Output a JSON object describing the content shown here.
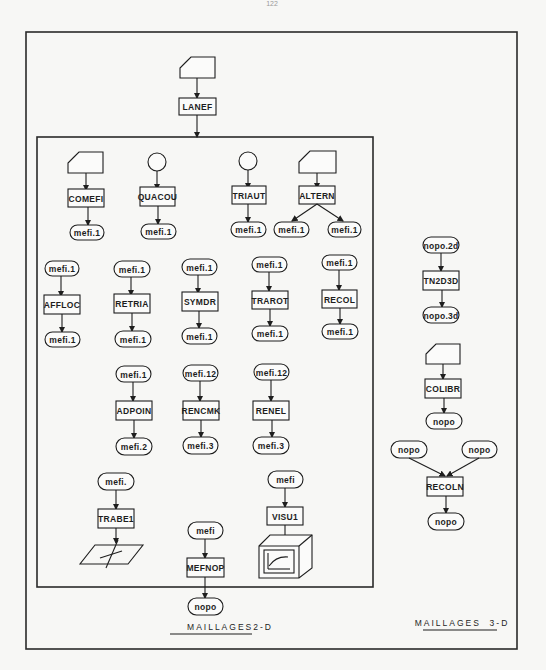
{
  "page": {
    "number": "122"
  },
  "colors": {
    "ink": "#1e1e1e",
    "paper": "#f7f7f5"
  },
  "top": {
    "input": {
      "kind": "card"
    },
    "process": "LANEF"
  },
  "sections": {
    "two_d": {
      "caption": "MAILLAGES2-D",
      "row1": [
        {
          "input": "card",
          "process": "COMEFI",
          "outputs": [
            "mefi.1"
          ]
        },
        {
          "input": "circle",
          "process": "QUACOU",
          "outputs": [
            "mefi.1"
          ]
        },
        {
          "input": "circle",
          "process": "TRIAUT",
          "outputs": [
            "mefi.1"
          ]
        },
        {
          "input": "card",
          "process": "ALTERN",
          "outputs": [
            "mefi.1",
            "mefi.1"
          ]
        }
      ],
      "row2": [
        {
          "input": "mefi.1",
          "process": "AFFLOC",
          "output": "mefi.1"
        },
        {
          "input": "mefi.1",
          "process": "RETRIA",
          "output": "mefi.1"
        },
        {
          "input": "mefi.1",
          "process": "SYMDR",
          "output": "mefi.1"
        },
        {
          "input": "mefi.1",
          "process": "TRAROT",
          "output": "mefi.1"
        },
        {
          "input": "mefi.1",
          "process": "RECOL",
          "output": "mefi.1"
        }
      ],
      "row3": [
        {
          "input": "mefi.1",
          "process": "ADPOIN",
          "output": "mefi.2"
        },
        {
          "input": "mefi.12",
          "process": "RENCMK",
          "output": "mefi.3"
        },
        {
          "input": "mefi.12",
          "process": "RENEL",
          "output": "mefi.3"
        }
      ],
      "row4": [
        {
          "input": "mefi.",
          "process": "TRABE1",
          "output_icon": "plane-icon"
        },
        {
          "input": "mefi",
          "process": "MEFNOP",
          "output": "nopo"
        },
        {
          "input": "mefi",
          "process": "VISU1",
          "output_icon": "display-terminal-icon"
        }
      ]
    },
    "three_d": {
      "caption": "MAILLAGES  3-D",
      "chain1": {
        "input": "nopo.2d",
        "process": "TN2D3D",
        "output": "nopo.3d"
      },
      "chain2": {
        "input": "card",
        "process": "COLIBR",
        "output": "nopo"
      },
      "chain3": {
        "inputs": [
          "nopo",
          "nopo"
        ],
        "process": "RECOLN",
        "output": "nopo"
      }
    }
  }
}
